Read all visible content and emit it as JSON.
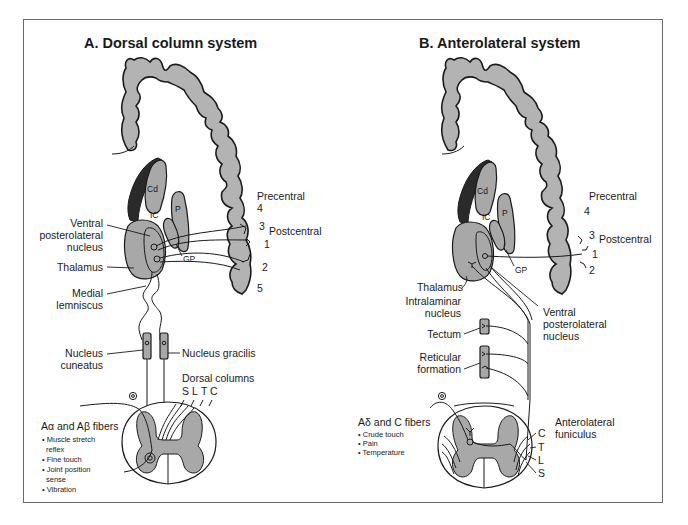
{
  "panels": {
    "a": {
      "title": "A. Dorsal column system",
      "labels": {
        "cd": "Cd",
        "ic": "IC",
        "p": "P",
        "gp": "GP",
        "precentral": "Precentral",
        "postcentral": "Postcentral",
        "area_4": "4",
        "area_3": "3",
        "area_1": "1",
        "area_2": "2",
        "area_5": "5",
        "vpl_line1": "Ventral",
        "vpl_line2": "posterolateral",
        "vpl_line3": "nucleus",
        "thalamus": "Thalamus",
        "ml_line1": "Medial",
        "ml_line2": "lemniscus",
        "cuneatus_line1": "Nucleus",
        "cuneatus_line2": "cuneatus",
        "gracilis": "Nucleus gracilis",
        "dorsal_columns": "Dorsal columns",
        "dc_segments": [
          "S",
          "L",
          "T",
          "C"
        ]
      },
      "fibers": {
        "heading_pre": "A",
        "alpha": "α",
        "heading_mid": " and A",
        "beta": "β",
        "heading_post": " fibers",
        "items": [
          "• Muscle stretch",
          "  reflex",
          "• Fine touch",
          "• Joint position",
          "  sense",
          "• Vibration"
        ]
      }
    },
    "b": {
      "title": "B. Anterolateral system",
      "labels": {
        "cd": "Cd",
        "ic": "IC",
        "p": "P",
        "gp": "GP",
        "precentral": "Precentral",
        "postcentral": "Postcentral",
        "area_4": "4",
        "area_3": "3",
        "area_1": "1",
        "area_2": "2",
        "thalamus": "Thalamus",
        "intralaminar_line1": "Intralaminar",
        "intralaminar_line2": "nucleus",
        "vpl_line1": "Ventral",
        "vpl_line2": "posterolateral",
        "vpl_line3": "nucleus",
        "tectum": "Tectum",
        "reticular_line1": "Reticular",
        "reticular_line2": "formation",
        "al_line1": "Anterolateral",
        "al_line2": "funiculus",
        "al_segments": [
          "C",
          "T",
          "L",
          "S"
        ]
      },
      "fibers": {
        "heading_pre": "A",
        "delta": "δ",
        "heading_post": " and C fibers",
        "items": [
          "• Crude touch",
          "• Pain",
          "• Temperature"
        ]
      }
    }
  },
  "colors": {
    "gray_matter": "#b3b3b3",
    "ventricle": "#2a2a2a",
    "line": "#1a1a1a",
    "frame": "#6a6a6a"
  }
}
